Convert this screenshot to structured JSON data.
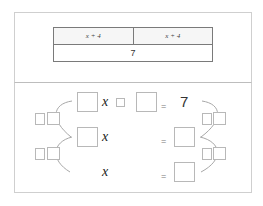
{
  "bar_model": {
    "top_cells": [
      "x + 4",
      "x + 4"
    ],
    "bottom_total": "7"
  },
  "equations": {
    "row1": {
      "variable": "x",
      "equals": "=",
      "result": "7"
    },
    "row2": {
      "variable": "x",
      "equals": "="
    },
    "row3": {
      "variable": "x",
      "equals": "="
    }
  },
  "colors": {
    "border": "#b8b8b8",
    "table_border": "#7a7a7a",
    "arc": "#a8a8a8"
  }
}
